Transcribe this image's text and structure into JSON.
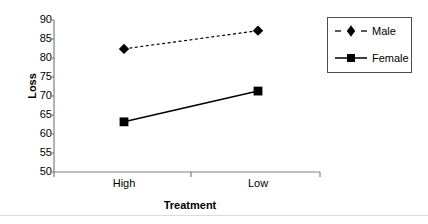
{
  "chart_data": {
    "type": "line",
    "title": "",
    "subtitle": "",
    "xlabel": "Treatment",
    "ylabel": "Loss",
    "categories": [
      "High",
      "Low"
    ],
    "series": [
      {
        "name": "Male",
        "values": [
          82.4,
          87.2
        ],
        "marker": "diamond",
        "linestyle": "dashed",
        "color": "#000000"
      },
      {
        "name": "Female",
        "values": [
          63.2,
          71.3
        ],
        "marker": "square",
        "linestyle": "solid",
        "color": "#000000"
      }
    ],
    "ylim": [
      50,
      90
    ],
    "yticks": [
      50,
      55,
      60,
      65,
      70,
      75,
      80,
      85,
      90
    ],
    "ytick_labels": [
      "50",
      "55",
      "60",
      "65",
      "70",
      "75",
      "80",
      "85",
      "90"
    ],
    "xtick_labels": [
      "High",
      "Low"
    ],
    "grid": false,
    "legend_position": "right",
    "legend_entries": [
      "Male",
      "Female"
    ],
    "legend_border_color": "#4d4d4d",
    "axis_color": "#808080",
    "background": "#ffffff"
  },
  "icons": {
    "diamond_marker": "diamond-marker-icon",
    "square_marker": "square-marker-icon"
  }
}
